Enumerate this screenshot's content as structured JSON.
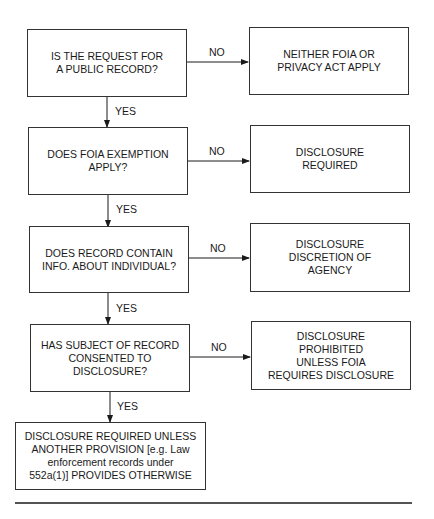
{
  "flowchart": {
    "decisions": [
      {
        "text": "IS THE REQUEST FOR\nA PUBLIC RECORD?"
      },
      {
        "text": "DOES FOIA EXEMPTION\nAPPLY?"
      },
      {
        "text": "DOES RECORD CONTAIN\nINFO. ABOUT INDIVIDUAL?"
      },
      {
        "text": "HAS SUBJECT OF RECORD\nCONSENTED TO\nDISCLOSURE?"
      }
    ],
    "outcomes_no": [
      {
        "text": "NEITHER FOIA OR\nPRIVACY ACT APPLY"
      },
      {
        "text": "DISCLOSURE\nREQUIRED"
      },
      {
        "text": "DISCLOSURE\nDISCRETION OF\nAGENCY"
      },
      {
        "text": "DISCLOSURE\nPROHIBITED\nUNLESS FOIA\nREQUIRES DISCLOSURE"
      }
    ],
    "final_outcome": {
      "text": "DISCLOSURE REQUIRED UNLESS\nANOTHER PROVISION [e.g. Law\nenforcement records under\n552a(1)] PROVIDES OTHERWISE"
    },
    "labels": {
      "no": "NO",
      "yes": "YES"
    }
  }
}
